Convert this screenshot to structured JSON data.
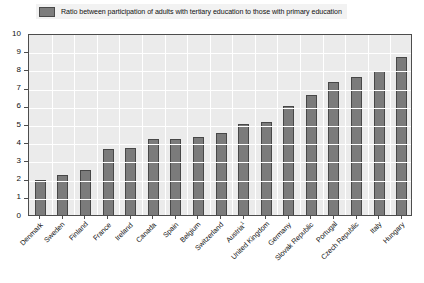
{
  "legend": {
    "label": "Ratio between participation of adults with tertiary education to those with primary education",
    "swatch_color": "#7d7d7d",
    "swatch_border": "#4a4a4a"
  },
  "colors": {
    "bar_fill": "#7b7b7b",
    "bar_border": "#474747",
    "plot_background": "#ebebeb",
    "gridline": "#ffffff",
    "axis": "#4d4d4d",
    "legend_background": "#f2f2f2",
    "text": "#111111"
  },
  "footnote_marker": "1",
  "chart_data": {
    "type": "bar",
    "title": "",
    "subtitle": "",
    "xlabel": "",
    "ylabel": "",
    "ylim": [
      0,
      10
    ],
    "ytick_step": 1,
    "yticks": [
      "10",
      "9",
      "8",
      "7",
      "6",
      "5",
      "4",
      "3",
      "2",
      "1",
      "0"
    ],
    "grid": true,
    "grid_axes": "both",
    "legend_position": "top",
    "legend_entries": [
      "Ratio between participation of adults with tertiary education to those with primary education"
    ],
    "categories": [
      "Denmark",
      "Sweden",
      "Finland",
      "France",
      "Ireland",
      "Canada",
      "Spain",
      "Belgium",
      "Switzerland",
      "Austria¹",
      "United Kingdom",
      "Germany",
      "Slovak Republic",
      "Portugal",
      "Czech Republic",
      "Italy",
      "Hungary"
    ],
    "values": [
      1.9,
      2.2,
      2.5,
      3.6,
      3.7,
      4.2,
      4.2,
      4.3,
      4.5,
      5.0,
      5.1,
      6.0,
      6.6,
      7.3,
      7.6,
      7.9,
      8.7
    ],
    "series": [
      {
        "name": "Ratio between participation of adults with tertiary education to those with primary education",
        "values": [
          1.9,
          2.2,
          2.5,
          3.6,
          3.7,
          4.2,
          4.2,
          4.3,
          4.5,
          5.0,
          5.1,
          6.0,
          6.6,
          7.3,
          7.6,
          7.9,
          8.7
        ]
      }
    ]
  }
}
